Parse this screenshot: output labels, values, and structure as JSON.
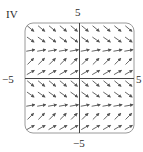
{
  "figure": {
    "panel_label": "IV",
    "axes": {
      "x_min_label": "−5",
      "x_max_label": "5",
      "y_min_label": "−5",
      "y_max_label": "5"
    },
    "plot_type": "slope field / vector field",
    "grid": {
      "cols": 10,
      "rows": 10
    },
    "row_angles_deg_top_to_bottom": [
      -40,
      -35,
      10,
      45,
      30,
      -40,
      -35,
      10,
      45,
      30
    ],
    "colors": {
      "arrow": "#555555",
      "frame": "#9a9a9a",
      "axis": "#444444"
    }
  }
}
